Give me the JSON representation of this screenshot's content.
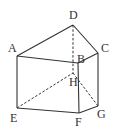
{
  "figure": {
    "type": "triangular-prism",
    "vertices": {
      "A": {
        "label": "A",
        "x": 17,
        "y": 56,
        "lx": 8,
        "ly": 52
      },
      "B": {
        "label": "B",
        "x": 78,
        "y": 63,
        "lx": 77,
        "ly": 63
      },
      "C": {
        "label": "C",
        "x": 98,
        "y": 53,
        "lx": 101,
        "ly": 52
      },
      "D": {
        "label": "D",
        "x": 73,
        "y": 25,
        "lx": 69,
        "ly": 19
      },
      "E": {
        "label": "E",
        "x": 17,
        "y": 108,
        "lx": 10,
        "ly": 122
      },
      "F": {
        "label": "F",
        "x": 79,
        "y": 113,
        "lx": 75,
        "ly": 126
      },
      "G": {
        "label": "G",
        "x": 98,
        "y": 106,
        "lx": 97,
        "ly": 118
      },
      "H": {
        "label": "H",
        "x": 73,
        "y": 73,
        "lx": 69,
        "ly": 86
      }
    },
    "solid_edges": [
      [
        "A",
        "D"
      ],
      [
        "D",
        "C"
      ],
      [
        "A",
        "B"
      ],
      [
        "B",
        "C"
      ],
      [
        "A",
        "E"
      ],
      [
        "B",
        "F"
      ],
      [
        "C",
        "G"
      ],
      [
        "E",
        "F"
      ],
      [
        "F",
        "G"
      ]
    ],
    "dashed_edges": [
      [
        "D",
        "H"
      ],
      [
        "E",
        "H"
      ],
      [
        "H",
        "G"
      ]
    ],
    "stroke_color": "#333333"
  }
}
